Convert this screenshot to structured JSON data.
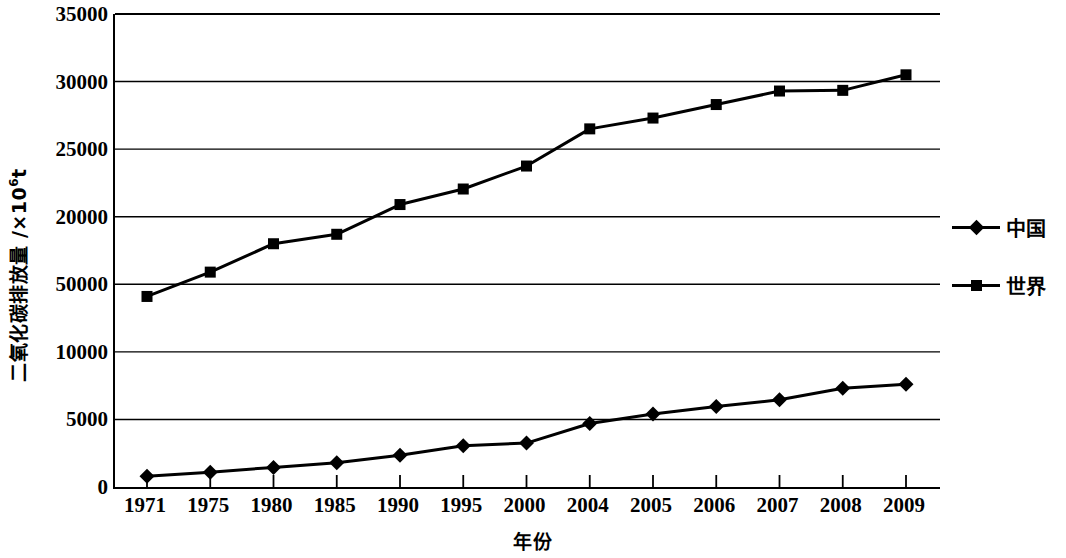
{
  "chart_data": {
    "type": "line",
    "title": "",
    "xlabel": "年份",
    "ylabel": "二氧化碳排放量 /×10⁶t",
    "ylabel_main": "二氧化碳排放量 /×10",
    "ylabel_sup": "6",
    "ylabel_unit": "t",
    "categories": [
      "1971",
      "1975",
      "1980",
      "1985",
      "1990",
      "1995",
      "2000",
      "2004",
      "2005",
      "2006",
      "2007",
      "2008",
      "2009"
    ],
    "ylim": [
      0,
      35000
    ],
    "ytick_values": [
      35000,
      30000,
      25000,
      20000,
      50000,
      10000,
      5000,
      0
    ],
    "ytick_labels": [
      "35000",
      "30000",
      "25000",
      "20000",
      "50000",
      "10000",
      "5000",
      "0"
    ],
    "ytick_positions": [
      35000,
      30000,
      25000,
      20000,
      15000,
      10000,
      5000,
      0
    ],
    "grid": true,
    "grid_axis": "y",
    "legend_position": "right",
    "series": [
      {
        "name": "中国",
        "marker": "diamond",
        "color": "#000000",
        "values": [
          800,
          1100,
          1450,
          1800,
          2350,
          3050,
          3250,
          4700,
          5400,
          5950,
          6450,
          7300,
          7600
        ]
      },
      {
        "name": "世界",
        "marker": "square",
        "color": "#000000",
        "values": [
          14100,
          15900,
          18000,
          18700,
          20900,
          22050,
          23750,
          26500,
          27300,
          28300,
          29300,
          29350,
          30500
        ]
      }
    ]
  },
  "legend": {
    "items": [
      {
        "label": "中国",
        "marker": "diamond"
      },
      {
        "label": "世界",
        "marker": "square"
      }
    ]
  }
}
